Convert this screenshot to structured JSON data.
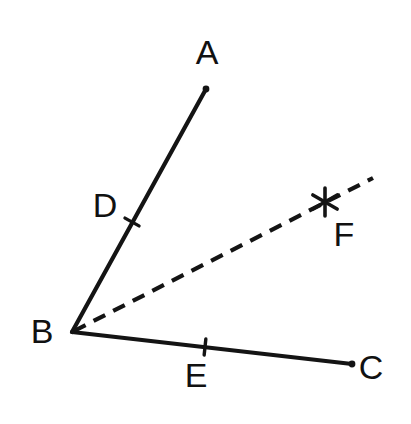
{
  "figure": {
    "type": "geometry-diagram",
    "background_color": "#ffffff",
    "stroke_color": "#141414",
    "canvas": {
      "width": 411,
      "height": 424
    },
    "points": {
      "A": {
        "label": "A",
        "label_x": 207,
        "label_y": 52,
        "x": 206,
        "y": 89
      },
      "B": {
        "label": "B",
        "label_x": 42,
        "label_y": 331,
        "x": 72,
        "y": 332
      },
      "C": {
        "label": "C",
        "label_x": 371,
        "label_y": 367,
        "x": 352,
        "y": 364
      },
      "D": {
        "label": "D",
        "label_x": 105,
        "label_y": 205,
        "x": 132,
        "y": 222
      },
      "E": {
        "label": "E",
        "label_x": 196,
        "label_y": 375,
        "x": 205,
        "y": 347
      },
      "F": {
        "label": "F",
        "label_x": 344,
        "label_y": 234,
        "x": 325,
        "y": 202
      }
    },
    "rays": [
      {
        "name": "ray-BA",
        "from": "B",
        "to": "A",
        "style": "solid",
        "x1": 72,
        "y1": 332,
        "x2": 206,
        "y2": 89
      },
      {
        "name": "ray-BC",
        "from": "B",
        "to": "C",
        "style": "solid",
        "x1": 72,
        "y1": 332,
        "x2": 352,
        "y2": 364
      },
      {
        "name": "ray-BF",
        "from": "B",
        "to": "F",
        "style": "dashed",
        "x1": 74,
        "y1": 331,
        "x2": 373,
        "y2": 178
      }
    ],
    "ticks": [
      {
        "name": "tick-on-ray-BA-at-D",
        "x": 132,
        "y": 222,
        "angle_deg": -61
      },
      {
        "name": "tick-on-ray-BC-at-E",
        "x": 205,
        "y": 347,
        "angle_deg": 6
      }
    ],
    "markers": [
      {
        "name": "asterisk-marker-F",
        "glyph": "*",
        "x": 325,
        "y": 202,
        "radius": 14
      }
    ]
  }
}
